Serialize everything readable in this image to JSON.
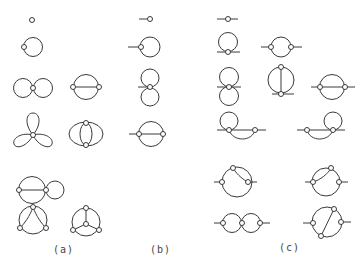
{
  "figure": {
    "panels": [
      {
        "id": "a",
        "label": "(a)",
        "description": "Vacuum diagrams (no external legs)"
      },
      {
        "id": "b",
        "label": "(b)",
        "description": "Diagrams with one external leg"
      },
      {
        "id": "c",
        "label": "(c)",
        "description": "Diagrams with two external legs"
      }
    ],
    "stroke_color": "#3a3a3a",
    "background": "#ffffff"
  }
}
